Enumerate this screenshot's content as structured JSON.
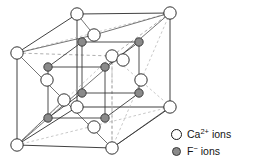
{
  "figure": {
    "colors": {
      "ca_fill": "#ffffff",
      "ca_stroke": "#1a1a1a",
      "f_fill": "#8a8a8a",
      "f_stroke": "#3a3a3a",
      "solid_edge": "#2b2b2b",
      "dashed_edge": "#9a9a9a",
      "inner_edge": "#3b3b3b",
      "background": "#ffffff"
    },
    "geometry": {
      "outer_cube_front_face": [
        {
          "x": 17,
          "y": 53
        },
        {
          "x": 77,
          "y": 14
        },
        {
          "x": 170,
          "y": 13
        },
        {
          "x": 171,
          "y": 107
        },
        {
          "x": 112,
          "y": 148
        },
        {
          "x": 17,
          "y": 145
        }
      ],
      "hidden_corner": {
        "x": 112,
        "y": 56
      },
      "outer_corners": [
        {
          "name": "top-back-left",
          "x": 77,
          "y": 14,
          "type": "ca"
        },
        {
          "name": "top-back-right",
          "x": 170,
          "y": 13,
          "type": "ca"
        },
        {
          "name": "top-front-left",
          "x": 17,
          "y": 53,
          "type": "ca"
        },
        {
          "name": "top-front-right",
          "x": 112,
          "y": 56,
          "type": "ca"
        },
        {
          "name": "bottom-back-left",
          "x": 77,
          "y": 107,
          "type": "ca"
        },
        {
          "name": "bottom-back-right",
          "x": 170,
          "y": 107,
          "type": "ca"
        },
        {
          "name": "bottom-front-left",
          "x": 17,
          "y": 145,
          "type": "ca"
        },
        {
          "name": "bottom-front-right",
          "x": 112,
          "y": 148,
          "type": "ca"
        }
      ],
      "face_centers": [
        {
          "name": "top-face",
          "x": 94,
          "y": 35,
          "type": "ca"
        },
        {
          "name": "bottom-face",
          "x": 94,
          "y": 127,
          "type": "ca"
        },
        {
          "name": "left-face",
          "x": 47,
          "y": 80,
          "type": "ca"
        },
        {
          "name": "right-face",
          "x": 141,
          "y": 80,
          "type": "ca"
        },
        {
          "name": "front-face",
          "x": 64,
          "y": 100,
          "type": "ca"
        },
        {
          "name": "back-face",
          "x": 123,
          "y": 60,
          "type": "ca"
        }
      ],
      "inner_cube_f_ions": [
        {
          "name": "f-top-back-left",
          "x": 82,
          "y": 42,
          "type": "f"
        },
        {
          "name": "f-top-back-right",
          "x": 139,
          "y": 42,
          "type": "f"
        },
        {
          "name": "f-top-front-left",
          "x": 48,
          "y": 67,
          "type": "f"
        },
        {
          "name": "f-top-front-right",
          "x": 105,
          "y": 67,
          "type": "f"
        },
        {
          "name": "f-bottom-back-left",
          "x": 82,
          "y": 93,
          "type": "f"
        },
        {
          "name": "f-bottom-back-right",
          "x": 139,
          "y": 93,
          "type": "f"
        },
        {
          "name": "f-bottom-front-left",
          "x": 48,
          "y": 118,
          "type": "f"
        },
        {
          "name": "f-bottom-front-right",
          "x": 105,
          "y": 118,
          "type": "f"
        }
      ],
      "ca_radius": 6.2,
      "f_radius": 4.2
    }
  },
  "legend": {
    "items": [
      {
        "icon": "open-circle-icon",
        "symbol": "Ca",
        "charge": "2+",
        "label": "Ca",
        "sup": "2+",
        "suffix": " ions",
        "full": "Ca2+ ions"
      },
      {
        "icon": "filled-circle-icon",
        "symbol": "F",
        "charge": "−",
        "label": "F",
        "sup": "−",
        "suffix": " ions",
        "full": "F− ions"
      }
    ]
  }
}
